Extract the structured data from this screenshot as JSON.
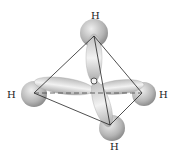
{
  "center_atom": {
    "label": "C",
    "x": 94,
    "y": 81
  },
  "hydrogens": [
    {
      "id": "top",
      "label": "H",
      "x": 94,
      "y": 37,
      "label_x": 95,
      "label_y": 18
    },
    {
      "id": "left",
      "label": "H",
      "x": 34,
      "y": 93,
      "label_x": 12,
      "label_y": 98
    },
    {
      "id": "right",
      "label": "H",
      "x": 142,
      "y": 93,
      "label_x": 164,
      "label_y": 98
    },
    {
      "id": "bottom",
      "label": "H",
      "x": 110,
      "y": 125,
      "label_x": 114,
      "label_y": 150
    }
  ],
  "colors": {
    "orbital": "#c8c8c8",
    "edge": "#222222",
    "label": "#222222"
  }
}
